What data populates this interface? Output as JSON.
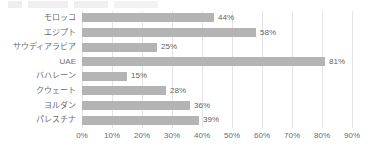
{
  "chart_data": {
    "type": "bar",
    "orientation": "horizontal",
    "title": "",
    "xlabel": "",
    "ylabel": "",
    "categories": [
      "モロッコ",
      "エジプト",
      "サウディアラビア",
      "UAE",
      "バハレーン",
      "クウェート",
      "ヨルダン",
      "パレスチナ"
    ],
    "values": [
      44,
      58,
      25,
      81,
      15,
      28,
      36,
      39
    ],
    "value_labels": [
      "44%",
      "58%",
      "25%",
      "81%",
      "15%",
      "28%",
      "36%",
      "39%"
    ],
    "xlim": [
      0,
      90
    ],
    "xticks": [
      0,
      10,
      20,
      30,
      40,
      50,
      60,
      70,
      80,
      90
    ],
    "xtick_labels": [
      "0%",
      "10%",
      "20%",
      "30%",
      "40%",
      "50%",
      "60%",
      "70%",
      "80%",
      "90%"
    ],
    "grid": true,
    "legend": false,
    "bar_color": "#b4b4b4",
    "gridline_color": "#e4e4e4",
    "text_color": "#6b6b6b"
  }
}
